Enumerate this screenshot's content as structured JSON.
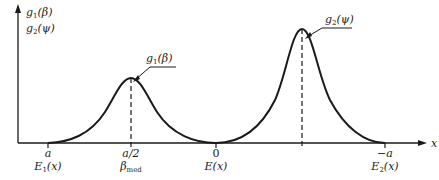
{
  "figure": {
    "y_axis_labels": [
      "g",
      "1",
      "(β)",
      "g",
      "2",
      "(ψ)"
    ],
    "y_axis_label_lines": {
      "line1": {
        "base": "g",
        "sub": "1",
        "arg": "(β)"
      },
      "line2": {
        "base": "g",
        "sub": "2",
        "arg": "(ψ)"
      }
    },
    "x_axis_label": "x",
    "curve_labels": {
      "curve1": {
        "base": "g",
        "sub": "1",
        "arg": "(β)"
      },
      "curve2": {
        "base": "g",
        "sub": "2",
        "arg": "(ψ)"
      }
    },
    "ticks": [
      {
        "value": "a",
        "desc_base": "E",
        "desc_sub": "1",
        "desc_arg": "(x)"
      },
      {
        "value": "a/2",
        "desc_base": "β",
        "desc_sub": "med",
        "desc_arg": ""
      },
      {
        "value": "0",
        "desc_base": "E",
        "desc_sub": "",
        "desc_arg": "(x)"
      },
      {
        "value": "−a",
        "desc_base": "E",
        "desc_sub": "2",
        "desc_arg": "(x)"
      }
    ],
    "colors": {
      "ink": "#1a1a1a",
      "background": "#ffffff"
    }
  }
}
